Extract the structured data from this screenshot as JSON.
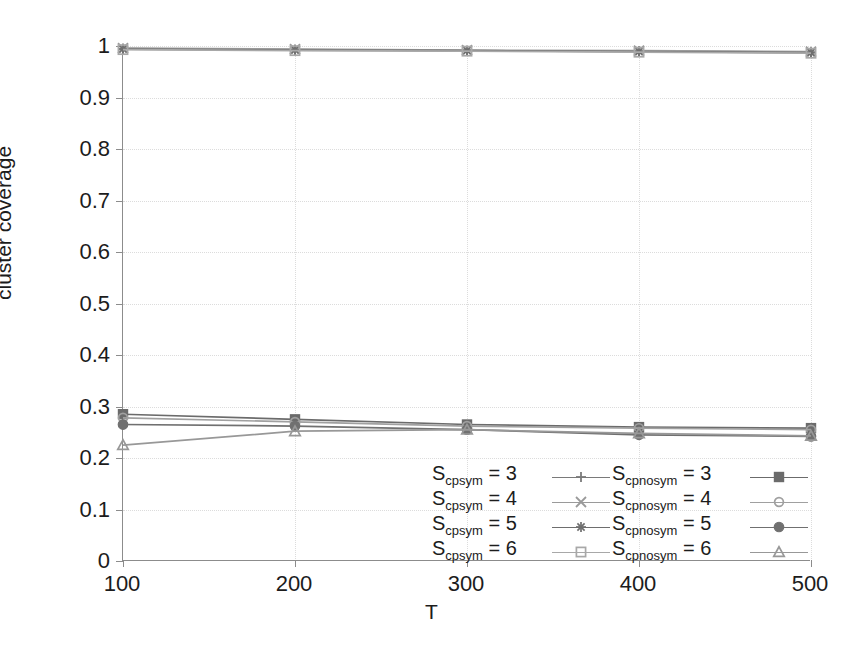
{
  "chart_data": {
    "type": "line",
    "title": "",
    "xlabel": "T",
    "ylabel": "cluster coverage",
    "x": [
      100,
      200,
      300,
      400,
      500
    ],
    "xlim": [
      100,
      500
    ],
    "ylim": [
      0,
      1
    ],
    "xticks": [
      "100",
      "200",
      "300",
      "400",
      "500"
    ],
    "yticks": [
      "0",
      "0.1",
      "0.2",
      "0.3",
      "0.4",
      "0.5",
      "0.6",
      "0.7",
      "0.8",
      "0.9",
      "1"
    ],
    "ytick_values": [
      0,
      0.1,
      0.2,
      0.3,
      0.4,
      0.5,
      0.6,
      0.7,
      0.8,
      0.9,
      1
    ],
    "grid": true,
    "legend_position": "lower right",
    "legend_border": false,
    "series": [
      {
        "name": "S_cp_sym = 3",
        "label_base": "S",
        "label_sub_main": "cp",
        "label_sub_sub": "sym",
        "label_value": "= 3",
        "marker": "plus",
        "color": "#7a7a7a",
        "values": [
          0.995,
          0.993,
          0.991,
          0.99,
          0.988
        ]
      },
      {
        "name": "S_cp_sym = 4",
        "label_base": "S",
        "label_sub_main": "cp",
        "label_sub_sub": "sym",
        "label_value": "= 4",
        "marker": "cross",
        "color": "#9a9a9a",
        "values": [
          0.996,
          0.994,
          0.992,
          0.991,
          0.989
        ]
      },
      {
        "name": "S_cp_sym = 5",
        "label_base": "S",
        "label_sub_main": "cp",
        "label_sub_sub": "sym",
        "label_value": "= 5",
        "marker": "star",
        "color": "#6e6e6e",
        "values": [
          0.994,
          0.992,
          0.991,
          0.989,
          0.987
        ]
      },
      {
        "name": "S_cp_sym = 6",
        "label_base": "S",
        "label_sub_main": "cp",
        "label_sub_sub": "sym",
        "label_value": "= 6",
        "marker": "open-square",
        "color": "#a8a8a8",
        "values": [
          0.993,
          0.991,
          0.99,
          0.988,
          0.986
        ]
      },
      {
        "name": "S_cp_nosym = 3",
        "label_base": "S",
        "label_sub_main": "cp",
        "label_sub_sub": "nosym",
        "label_value": "= 3",
        "marker": "filled-square",
        "color": "#6b6b6b",
        "values": [
          0.285,
          0.275,
          0.265,
          0.26,
          0.258
        ]
      },
      {
        "name": "S_cp_nosym = 4",
        "label_base": "S",
        "label_sub_main": "cp",
        "label_sub_sub": "nosym",
        "label_value": "= 4",
        "marker": "open-circle",
        "color": "#a0a0a0",
        "values": [
          0.278,
          0.27,
          0.262,
          0.258,
          0.255
        ]
      },
      {
        "name": "S_cp_nosym = 5",
        "label_base": "S",
        "label_sub_main": "cp",
        "label_sub_sub": "nosym",
        "label_value": "= 5",
        "marker": "filled-circle",
        "color": "#707070",
        "values": [
          0.265,
          0.262,
          0.255,
          0.245,
          0.242
        ]
      },
      {
        "name": "S_cp_nosym = 6",
        "label_base": "S",
        "label_sub_main": "cp",
        "label_sub_sub": "nosym",
        "label_value": "= 6",
        "marker": "open-triangle",
        "color": "#989898",
        "values": [
          0.225,
          0.252,
          0.255,
          0.248,
          0.243
        ]
      }
    ]
  },
  "axis": {
    "x_title": "T",
    "y_title": "cluster coverage"
  }
}
